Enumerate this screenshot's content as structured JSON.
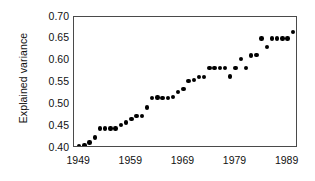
{
  "chart_data": {
    "type": "scatter",
    "title": "",
    "xlabel": "",
    "ylabel": "Explained variance",
    "xlim": [
      1948,
      1991
    ],
    "ylim": [
      0.4,
      0.7
    ],
    "xticks": [
      1949,
      1959,
      1969,
      1979,
      1989
    ],
    "xtick_labels": [
      "1949",
      "1959",
      "1969",
      "1979",
      "1989"
    ],
    "yticks": [
      0.4,
      0.45,
      0.5,
      0.55,
      0.6,
      0.65,
      0.7
    ],
    "ytick_labels": [
      "0.40",
      "0.45",
      "0.50",
      "0.55",
      "0.60",
      "0.65",
      "0.70"
    ],
    "grid": false,
    "legend": null,
    "marker": "filled-circle",
    "marker_color": "#000000",
    "frame_color": "#4a4a4a",
    "x": [
      1949,
      1950,
      1951,
      1952,
      1953,
      1954,
      1955,
      1956,
      1957,
      1958,
      1959,
      1960,
      1961,
      1962,
      1963,
      1964,
      1965,
      1966,
      1967,
      1968,
      1969,
      1970,
      1971,
      1972,
      1973,
      1974,
      1975,
      1976,
      1977,
      1978,
      1979,
      1980,
      1981,
      1982,
      1983,
      1984,
      1985,
      1986,
      1987,
      1988,
      1989,
      1990
    ],
    "y": [
      0.405,
      0.406,
      0.413,
      0.424,
      0.445,
      0.445,
      0.445,
      0.445,
      0.452,
      0.458,
      0.467,
      0.473,
      0.473,
      0.493,
      0.515,
      0.516,
      0.515,
      0.515,
      0.517,
      0.528,
      0.535,
      0.554,
      0.556,
      0.563,
      0.563,
      0.583,
      0.583,
      0.583,
      0.583,
      0.564,
      0.583,
      0.604,
      0.583,
      0.612,
      0.613,
      0.651,
      0.632,
      0.651,
      0.651,
      0.651,
      0.651,
      0.665
    ],
    "point_count": 42
  }
}
